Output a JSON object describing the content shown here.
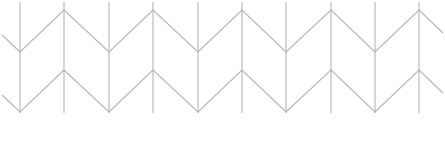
{
  "pattern": {
    "name": "chevron-herringbone-lines",
    "stroke_color": "#b4b4b4",
    "stroke_width": 1.1,
    "verticals": {
      "x": [
        20,
        64,
        109,
        153,
        198,
        242,
        286,
        331,
        375,
        419
      ],
      "y_top": 2,
      "y_bottom": 113
    },
    "zigzag_rows": [
      {
        "points": [
          [
            2,
            35
          ],
          [
            20,
            52
          ],
          [
            64,
            10
          ],
          [
            109,
            52
          ],
          [
            153,
            10
          ],
          [
            198,
            52
          ],
          [
            242,
            10
          ],
          [
            286,
            52
          ],
          [
            331,
            10
          ],
          [
            375,
            52
          ],
          [
            419,
            10
          ],
          [
            443,
            33
          ]
        ]
      },
      {
        "points": [
          [
            2,
            95
          ],
          [
            20,
            112
          ],
          [
            64,
            70
          ],
          [
            109,
            112
          ],
          [
            153,
            70
          ],
          [
            198,
            112
          ],
          [
            242,
            70
          ],
          [
            286,
            112
          ],
          [
            331,
            70
          ],
          [
            375,
            112
          ],
          [
            419,
            70
          ],
          [
            443,
            93
          ]
        ]
      }
    ]
  }
}
